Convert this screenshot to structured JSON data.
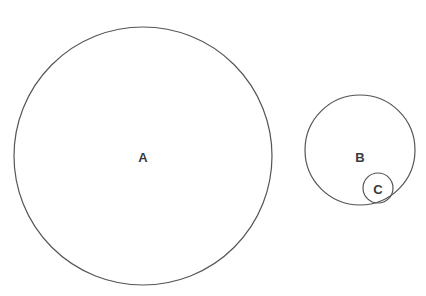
{
  "diagram": {
    "type": "nested-circles",
    "background": "#ffffff",
    "stroke_color": "#555555",
    "label_color": "#3a3a3a",
    "circles": [
      {
        "id": "A",
        "label": "A",
        "cx": 143,
        "cy": 156,
        "r": 129,
        "contains": []
      },
      {
        "id": "B",
        "label": "B",
        "cx": 360,
        "cy": 150,
        "r": 55,
        "contains": [
          "C"
        ]
      },
      {
        "id": "C",
        "label": "C",
        "cx": 378,
        "cy": 188,
        "r": 15,
        "contains": []
      }
    ],
    "labels": {
      "A": {
        "text": "A",
        "x": 143,
        "y": 157
      },
      "B": {
        "text": "B",
        "x": 360,
        "y": 157
      },
      "C": {
        "text": "C",
        "x": 378,
        "y": 189
      }
    }
  }
}
